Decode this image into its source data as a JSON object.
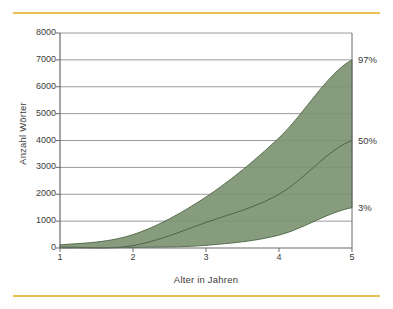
{
  "figure": {
    "top_rule_color": "#e8c156",
    "bottom_rule_color": "#e8c156"
  },
  "chart_data": {
    "type": "area",
    "title": "",
    "subtitle": "",
    "xlabel": "Alter in Jahren",
    "ylabel": "Anzahl Wörter",
    "xlim": [
      1,
      5
    ],
    "ylim": [
      0,
      8000
    ],
    "x": [
      1,
      2,
      3,
      4,
      5
    ],
    "xticks": [
      "1",
      "2",
      "3",
      "4",
      "5"
    ],
    "yticks": [
      "0",
      "1000",
      "2000",
      "3000",
      "4000",
      "5000",
      "6000",
      "7000",
      "8000"
    ],
    "ytick_values": [
      0,
      1000,
      2000,
      3000,
      4000,
      5000,
      6000,
      7000,
      8000
    ],
    "grid": "horizontal",
    "legend_position": "right-edge-annotations",
    "band_fill_color": "#7d9472",
    "band_line_color": "#4c6444",
    "grid_color": "#8f8f8f",
    "axis_color": "#6b6b6b",
    "series": [
      {
        "name": "97%",
        "label": "97%",
        "values": [
          120,
          500,
          1900,
          4100,
          7000
        ]
      },
      {
        "name": "50%",
        "label": "50%",
        "values": [
          30,
          90,
          950,
          2000,
          4000
        ]
      },
      {
        "name": "3%",
        "label": "3%",
        "values": [
          0,
          20,
          100,
          480,
          1500
        ]
      }
    ],
    "annotations": [
      {
        "text": "97%",
        "value": 7000
      },
      {
        "text": "50%",
        "value": 4000
      },
      {
        "text": "3%",
        "value": 1500
      }
    ]
  }
}
